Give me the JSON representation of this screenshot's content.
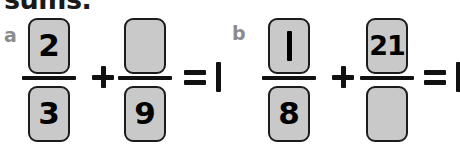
{
  "heading": {
    "text": "sums.",
    "clipped": true
  },
  "problems": [
    {
      "letter": "a",
      "fraction_1": {
        "numerator": "2",
        "denominator": "3",
        "numerator_blank": false,
        "denominator_blank": false
      },
      "operator": "+",
      "fraction_2": {
        "numerator": "",
        "denominator": "9",
        "numerator_blank": true,
        "denominator_blank": false
      },
      "equals": "=",
      "result": "1"
    },
    {
      "letter": "b",
      "fraction_1": {
        "numerator": "1",
        "denominator": "8",
        "numerator_blank": false,
        "denominator_blank": false
      },
      "operator": "+",
      "fraction_2": {
        "numerator": "21",
        "denominator": "",
        "numerator_blank": false,
        "denominator_blank": true
      },
      "equals": "=",
      "result": "1"
    }
  ],
  "colors": {
    "box_fill": "#c9c9c9",
    "box_border": "#1c1c1c",
    "ink": "#111111",
    "part_letter": "#8c8c8c",
    "background": "#ffffff"
  }
}
